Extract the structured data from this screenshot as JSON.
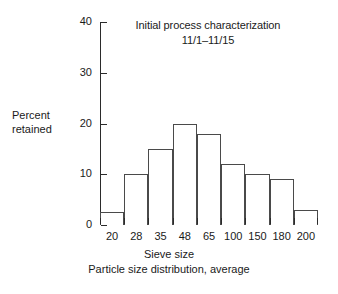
{
  "chart_data": {
    "type": "bar",
    "title": "Initial process characterization",
    "subtitle": "11/1–11/15",
    "xlabel": "Sieve size",
    "ylabel": "Percent retained",
    "ylabel_line1": "Percent",
    "ylabel_line2": "retained",
    "caption": "Particle size distribution, average",
    "categories": [
      "20",
      "28",
      "35",
      "48",
      "65",
      "100",
      "150",
      "180",
      "200"
    ],
    "values": [
      2.5,
      10,
      15,
      20,
      18,
      12,
      10,
      9,
      3
    ],
    "ylim": [
      0,
      40
    ],
    "yticks": [
      0,
      10,
      20,
      30,
      40
    ],
    "ytick_labels": [
      "0",
      "10",
      "20",
      "30",
      "40"
    ],
    "grid": false,
    "legend": "none",
    "bar_edge_color": "#4a4a4a",
    "bar_fill_color": "#ffffff",
    "axis_color": "#2b2b2b",
    "background_color": "#ffffff"
  }
}
